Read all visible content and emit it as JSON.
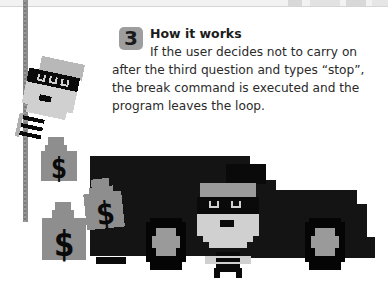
{
  "step": {
    "number": "3",
    "title": "How it works",
    "body_lines": [
      "If the user decides not to carry on",
      "after the third question and types “stop”,",
      "the break command is executed and the",
      "program leaves the loop."
    ]
  },
  "illustration": {
    "elements": [
      "burglar-climbing-rope",
      "money-bag",
      "money-bag",
      "money-bag",
      "getaway-van",
      "burglar-by-van"
    ],
    "colors": {
      "van": "#141414",
      "gray_light": "#c8c8c8",
      "gray_mid": "#8e8e8e",
      "black": "#0a0a0a"
    }
  }
}
